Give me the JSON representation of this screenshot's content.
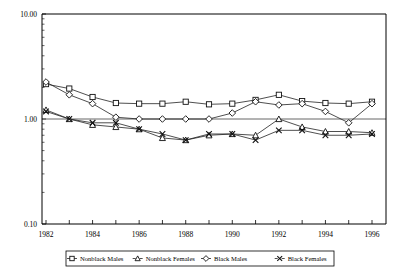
{
  "chart_data": {
    "type": "line",
    "title": "",
    "xlabel": "",
    "ylabel": "",
    "yscale": "log",
    "ylim": [
      0.1,
      10.0
    ],
    "xlim": [
      1982,
      1996
    ],
    "grid": false,
    "reference_line": 1.0,
    "legend_position": "bottom",
    "y_ticks": [
      "10.00",
      "1.00",
      "0.10"
    ],
    "y_tick_values": [
      10.0,
      1.0,
      0.1
    ],
    "x_ticks": [
      "1982",
      "1984",
      "1986",
      "1988",
      "1990",
      "1992",
      "1994",
      "1996"
    ],
    "x_tick_values": [
      1982,
      1984,
      1986,
      1988,
      1990,
      1992,
      1994,
      1996
    ],
    "x_all_years": [
      1982,
      1983,
      1984,
      1985,
      1986,
      1987,
      1988,
      1989,
      1990,
      1991,
      1992,
      1993,
      1994,
      1995,
      1996
    ],
    "series": [
      {
        "name": "Nonblack Males",
        "marker": "square",
        "values": [
          2.15,
          1.95,
          1.62,
          1.42,
          1.4,
          1.4,
          1.46,
          1.38,
          1.4,
          1.52,
          1.7,
          1.48,
          1.42,
          1.4,
          1.46
        ]
      },
      {
        "name": "Nonblack Females",
        "marker": "triangle",
        "values": [
          1.22,
          1.0,
          0.88,
          0.84,
          0.8,
          0.66,
          0.63,
          0.7,
          0.72,
          0.7,
          1.0,
          0.84,
          0.76,
          0.76,
          0.74
        ]
      },
      {
        "name": "Black Males",
        "marker": "diamond",
        "values": [
          2.25,
          1.7,
          1.4,
          1.04,
          1.0,
          1.0,
          1.0,
          1.0,
          1.14,
          1.46,
          1.36,
          1.4,
          1.18,
          0.92,
          1.4
        ]
      },
      {
        "name": "Black Females",
        "marker": "x",
        "values": [
          1.18,
          1.0,
          0.92,
          0.92,
          0.8,
          0.72,
          0.63,
          0.72,
          0.72,
          0.63,
          0.78,
          0.78,
          0.7,
          0.7,
          0.72
        ]
      }
    ]
  },
  "legend": {
    "items": [
      {
        "label": "Nonblack Males",
        "marker": "square"
      },
      {
        "label": "Nonblack Females",
        "marker": "triangle"
      },
      {
        "label": "Black Males",
        "marker": "diamond"
      },
      {
        "label": "Black Females",
        "marker": "x"
      }
    ]
  }
}
